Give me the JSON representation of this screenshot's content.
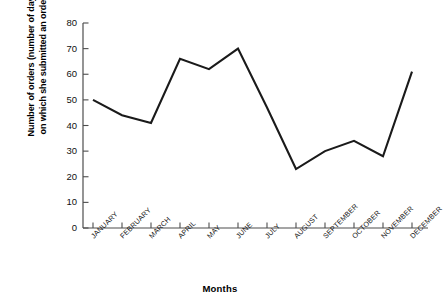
{
  "chart_data": {
    "type": "line",
    "title": "",
    "xlabel": "Months",
    "ylabel": "Number of orders (number of days on which she submitted an order)",
    "ylabel_line1": "Number of orders (number of days",
    "ylabel_line2": "on which she submitted an order)",
    "categories": [
      "JANUARY",
      "FEBRUARY",
      "MARCH",
      "APRIL",
      "MAY",
      "JUNE",
      "JULY",
      "AUGUST",
      "SEPTEMBER",
      "OCTOBER",
      "NOVEMBER",
      "DECEMBER"
    ],
    "values": [
      50,
      44,
      41,
      66,
      62,
      70,
      47,
      23,
      30,
      34,
      28,
      61
    ],
    "ylim": [
      0,
      80
    ],
    "yticks": [
      0,
      10,
      20,
      30,
      40,
      50,
      60,
      70,
      80
    ],
    "ytick_labels": [
      "0",
      "10",
      "20",
      "30",
      "40",
      "50",
      "60",
      "70",
      "80"
    ],
    "grid": false,
    "legend": false,
    "line_color": "#1a1a1a",
    "axis_color": "#4d4d4d"
  }
}
